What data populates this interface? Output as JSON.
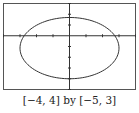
{
  "chart_data": {
    "type": "line",
    "title": "",
    "caption": "[−4, 4] by [−5, 3]",
    "xlabel": "",
    "ylabel": "",
    "xlim": [
      -4,
      4
    ],
    "ylim": [
      -5,
      3
    ],
    "xscale_ticks": 1,
    "yscale_ticks": 1,
    "grid": false,
    "legend": null,
    "series": [
      {
        "name": "ellipse",
        "shape": "ellipse",
        "center": [
          0,
          -1.15
        ],
        "semi_axis_x": 3,
        "semi_axis_y": 2.85,
        "color": "#333333"
      }
    ]
  },
  "colors": {
    "frame": "#555555",
    "axes": "#333333",
    "curve": "#333333",
    "background": "#ffffff"
  }
}
